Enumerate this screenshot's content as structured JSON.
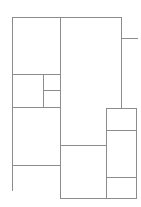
{
  "diagram": {
    "type": "floor-plan-partition",
    "width": 141,
    "height": 207,
    "stroke_color": "#8c8c8c",
    "background": "#ffffff",
    "lines": [
      {
        "id": "outer-top",
        "x1": 12,
        "y1": 17,
        "x2": 121,
        "y2": 17
      },
      {
        "id": "left-edge",
        "x1": 12,
        "y1": 17,
        "x2": 12,
        "y2": 190
      },
      {
        "id": "center-vertical",
        "x1": 60,
        "y1": 17,
        "x2": 60,
        "y2": 198
      },
      {
        "id": "right-vertical",
        "x1": 121,
        "y1": 17,
        "x2": 121,
        "y2": 108
      },
      {
        "id": "right-branch",
        "x1": 121,
        "y1": 38,
        "x2": 137,
        "y2": 38
      },
      {
        "id": "left-split-1",
        "x1": 12,
        "y1": 74,
        "x2": 60,
        "y2": 74
      },
      {
        "id": "inner-vertical",
        "x1": 43,
        "y1": 74,
        "x2": 43,
        "y2": 107
      },
      {
        "id": "inner-horizontal",
        "x1": 43,
        "y1": 90,
        "x2": 60,
        "y2": 90
      },
      {
        "id": "left-split-2",
        "x1": 12,
        "y1": 107,
        "x2": 60,
        "y2": 107
      },
      {
        "id": "left-split-3",
        "x1": 12,
        "y1": 165,
        "x2": 60,
        "y2": 165
      },
      {
        "id": "center-horizontal",
        "x1": 60,
        "y1": 145,
        "x2": 106,
        "y2": 145
      },
      {
        "id": "right-box-top",
        "x1": 106,
        "y1": 108,
        "x2": 136,
        "y2": 108
      },
      {
        "id": "right-box-left",
        "x1": 106,
        "y1": 108,
        "x2": 106,
        "y2": 198
      },
      {
        "id": "right-box-right",
        "x1": 136,
        "y1": 108,
        "x2": 136,
        "y2": 198
      },
      {
        "id": "right-box-split-1",
        "x1": 106,
        "y1": 130,
        "x2": 136,
        "y2": 130
      },
      {
        "id": "right-box-split-2",
        "x1": 106,
        "y1": 177,
        "x2": 136,
        "y2": 177
      },
      {
        "id": "bottom-edge",
        "x1": 60,
        "y1": 198,
        "x2": 136,
        "y2": 198
      }
    ]
  }
}
